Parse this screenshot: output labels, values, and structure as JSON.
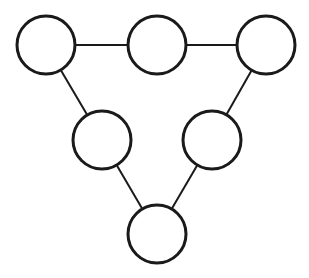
{
  "diagram": {
    "type": "graph",
    "width": 309,
    "height": 278,
    "stroke_color": "#1a1a1a",
    "fill_color": "#ffffff",
    "node_radius": 29,
    "node_stroke_width": 3,
    "edge_stroke_width": 2,
    "nodes": [
      {
        "id": "n1",
        "label": "",
        "x": 46,
        "y": 45
      },
      {
        "id": "n2",
        "label": "",
        "x": 157,
        "y": 45
      },
      {
        "id": "n3",
        "label": "",
        "x": 266,
        "y": 45
      },
      {
        "id": "n4",
        "label": "",
        "x": 102,
        "y": 140
      },
      {
        "id": "n5",
        "label": "",
        "x": 212,
        "y": 140
      },
      {
        "id": "n6",
        "label": "",
        "x": 157,
        "y": 234
      }
    ],
    "edges": [
      {
        "from": "n1",
        "to": "n2"
      },
      {
        "from": "n2",
        "to": "n3"
      },
      {
        "from": "n1",
        "to": "n4"
      },
      {
        "from": "n3",
        "to": "n5"
      },
      {
        "from": "n4",
        "to": "n6"
      },
      {
        "from": "n5",
        "to": "n6"
      }
    ]
  }
}
